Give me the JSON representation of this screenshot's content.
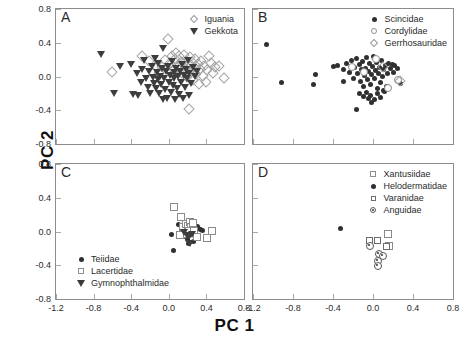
{
  "figure": {
    "xlabel": "PC 1",
    "ylabel": "PC 2"
  },
  "chart_data": {
    "type": "scatter",
    "title": "",
    "xlabel": "PC 1",
    "ylabel": "PC 2",
    "xlim": [
      -1.2,
      0.8
    ],
    "ylim": [
      -0.8,
      0.8
    ],
    "xticks": [
      "-1.2",
      "-0.8",
      "-0.4",
      "0.0",
      "0.4",
      "0.8"
    ],
    "yticks": [
      "0.8",
      "0.4",
      "0.0",
      "-0.4",
      "-0.8"
    ],
    "grid": false,
    "panels": [
      {
        "letter": "A",
        "legend_position": "top-right",
        "series": [
          {
            "name": "Iguania",
            "marker": "diamond-open",
            "points": [
              [
                -0.62,
                0.07
              ],
              [
                -0.3,
                0.26
              ],
              [
                -0.22,
                0.2
              ],
              [
                -0.15,
                0.14
              ],
              [
                -0.12,
                0.05
              ],
              [
                -0.08,
                0.12
              ],
              [
                -0.05,
                0.21
              ],
              [
                -0.02,
                0.46
              ],
              [
                0.0,
                0.17
              ],
              [
                0.02,
                0.26
              ],
              [
                0.04,
                0.09
              ],
              [
                0.06,
                0.22
              ],
              [
                0.07,
                0.29
              ],
              [
                0.09,
                0.13
              ],
              [
                0.1,
                0.25
              ],
              [
                0.12,
                0.18
              ],
              [
                0.13,
                0.05
              ],
              [
                0.15,
                0.27
              ],
              [
                0.16,
                0.11
              ],
              [
                0.17,
                0.2
              ],
              [
                0.18,
                0.01
              ],
              [
                0.2,
                0.15
              ],
              [
                0.21,
                0.24
              ],
              [
                0.22,
                0.08
              ],
              [
                0.24,
                0.18
              ],
              [
                0.25,
                -0.03
              ],
              [
                0.26,
                0.12
              ],
              [
                0.27,
                0.22
              ],
              [
                0.28,
                0.04
              ],
              [
                0.3,
                0.16
              ],
              [
                0.31,
                -0.08
              ],
              [
                0.32,
                0.1
              ],
              [
                0.33,
                0.2
              ],
              [
                0.35,
                0.02
              ],
              [
                0.36,
                0.14
              ],
              [
                0.38,
                -0.05
              ],
              [
                0.4,
                0.09
              ],
              [
                0.42,
                0.26
              ],
              [
                0.44,
                0.17
              ],
              [
                0.46,
                0.05
              ],
              [
                0.48,
                0.13
              ],
              [
                0.52,
                0.14
              ],
              [
                0.58,
                0.0
              ],
              [
                0.2,
                -0.37
              ]
            ]
          },
          {
            "name": "Gekkota",
            "marker": "triangle-down",
            "points": [
              [
                -0.72,
                0.27
              ],
              [
                -0.52,
                0.12
              ],
              [
                -0.58,
                -0.2
              ],
              [
                -0.4,
                0.15
              ],
              [
                -0.34,
                0.04
              ],
              [
                -0.3,
                -0.06
              ],
              [
                -0.28,
                0.09
              ],
              [
                -0.26,
                0.19
              ],
              [
                -0.24,
                -0.02
              ],
              [
                -0.22,
                -0.12
              ],
              [
                -0.21,
                0.06
              ],
              [
                -0.2,
                -0.19
              ],
              [
                -0.18,
                0.13
              ],
              [
                -0.17,
                0.0
              ],
              [
                -0.16,
                -0.08
              ],
              [
                -0.15,
                0.22
              ],
              [
                -0.14,
                -0.14
              ],
              [
                -0.13,
                0.05
              ],
              [
                -0.12,
                -0.03
              ],
              [
                -0.11,
                0.16
              ],
              [
                -0.1,
                -0.2
              ],
              [
                -0.09,
                0.01
              ],
              [
                -0.08,
                -0.09
              ],
              [
                -0.07,
                0.1
              ],
              [
                -0.06,
                0.34
              ],
              [
                -0.05,
                -0.02
              ],
              [
                -0.04,
                -0.15
              ],
              [
                -0.03,
                0.06
              ],
              [
                -0.02,
                -0.25
              ],
              [
                -0.01,
                0.12
              ],
              [
                0.0,
                -0.06
              ],
              [
                0.01,
                0.02
              ],
              [
                0.02,
                -0.18
              ],
              [
                0.03,
                0.18
              ],
              [
                0.04,
                -0.1
              ],
              [
                0.05,
                0.05
              ],
              [
                0.06,
                -0.02
              ],
              [
                0.07,
                -0.27
              ],
              [
                0.08,
                0.1
              ],
              [
                0.09,
                -0.14
              ],
              [
                0.1,
                0.01
              ],
              [
                0.11,
                -0.21
              ],
              [
                0.12,
                0.07
              ],
              [
                0.13,
                -0.06
              ],
              [
                0.14,
                0.15
              ],
              [
                0.15,
                -0.25
              ],
              [
                0.16,
                0.02
              ],
              [
                0.17,
                -0.12
              ],
              [
                0.18,
                0.09
              ],
              [
                0.19,
                -0.02
              ],
              [
                0.2,
                0.2
              ],
              [
                0.21,
                -0.22
              ],
              [
                0.22,
                0.04
              ],
              [
                0.24,
                -0.08
              ],
              [
                0.26,
                0.11
              ],
              [
                0.28,
                0.01
              ],
              [
                0.3,
                0.06
              ],
              [
                -0.38,
                -0.21
              ],
              [
                -0.33,
                -0.22
              ],
              [
                -0.06,
                -0.27
              ]
            ]
          }
        ]
      },
      {
        "letter": "B",
        "legend_position": "top-right",
        "series": [
          {
            "name": "Scincidae",
            "marker": "circle-filled",
            "points": [
              [
                -1.07,
                0.38
              ],
              [
                -0.92,
                -0.07
              ],
              [
                -0.58,
                0.02
              ],
              [
                -0.6,
                -0.1
              ],
              [
                -0.4,
                0.12
              ],
              [
                -0.36,
                0.13
              ],
              [
                -0.3,
                0.08
              ],
              [
                -0.27,
                0.16
              ],
              [
                -0.24,
                0.05
              ],
              [
                -0.22,
                0.19
              ],
              [
                -0.2,
                -0.02
              ],
              [
                -0.19,
                0.11
              ],
              [
                -0.17,
                0.21
              ],
              [
                -0.16,
                0.03
              ],
              [
                -0.14,
                0.14
              ],
              [
                -0.13,
                -0.06
              ],
              [
                -0.12,
                0.08
              ],
              [
                -0.11,
                0.18
              ],
              [
                -0.1,
                -0.12
              ],
              [
                -0.09,
                0.01
              ],
              [
                -0.08,
                0.1
              ],
              [
                -0.07,
                0.22
              ],
              [
                -0.06,
                -0.04
              ],
              [
                -0.05,
                0.06
              ],
              [
                -0.04,
                0.15
              ],
              [
                -0.03,
                -0.09
              ],
              [
                -0.02,
                0.02
              ],
              [
                -0.01,
                0.12
              ],
              [
                0.0,
                0.24
              ],
              [
                0.01,
                -0.02
              ],
              [
                0.02,
                0.07
              ],
              [
                0.03,
                0.17
              ],
              [
                0.04,
                -0.14
              ],
              [
                0.05,
                0.03
              ],
              [
                0.06,
                0.11
              ],
              [
                0.07,
                -0.07
              ],
              [
                0.08,
                0.19
              ],
              [
                0.09,
                0.0
              ],
              [
                0.1,
                0.08
              ],
              [
                0.11,
                -0.18
              ],
              [
                0.12,
                0.13
              ],
              [
                0.14,
                0.04
              ],
              [
                0.15,
                0.15
              ],
              [
                0.17,
                0.09
              ],
              [
                0.19,
                0.14
              ],
              [
                0.2,
                0.05
              ],
              [
                0.21,
                0.13
              ],
              [
                0.24,
                0.1
              ],
              [
                -0.14,
                -0.2
              ],
              [
                -0.1,
                -0.24
              ],
              [
                -0.07,
                -0.19
              ],
              [
                -0.05,
                -0.26
              ],
              [
                -0.03,
                -0.22
              ],
              [
                -0.02,
                -0.31
              ],
              [
                0.01,
                -0.27
              ],
              [
                0.04,
                -0.2
              ],
              [
                0.07,
                -0.25
              ],
              [
                -0.17,
                -0.39
              ],
              [
                0.1,
                -0.16
              ],
              [
                0.13,
                -0.12
              ],
              [
                0.27,
                -0.08
              ],
              [
                -0.3,
                -0.06
              ]
            ]
          },
          {
            "name": "Cordylidae",
            "marker": "circle-open",
            "points": [
              [
                -0.22,
                0.13
              ],
              [
                -0.1,
                0.07
              ],
              [
                0.02,
                0.22
              ],
              [
                0.24,
                -0.03
              ],
              [
                0.14,
                -0.12
              ]
            ]
          },
          {
            "name": "Gerrhosauridae",
            "marker": "diamond-open",
            "points": [
              [
                0.09,
                0.12
              ],
              [
                0.26,
                -0.04
              ]
            ]
          }
        ]
      },
      {
        "letter": "C",
        "legend_position": "bottom-left",
        "series": [
          {
            "name": "Teiidae",
            "marker": "circle-filled",
            "points": [
              [
                0.03,
                -0.03
              ],
              [
                0.1,
                0.08
              ],
              [
                0.13,
                0.02
              ],
              [
                0.16,
                -0.06
              ],
              [
                0.18,
                0.03
              ],
              [
                0.2,
                -0.1
              ],
              [
                0.22,
                0.05
              ],
              [
                0.24,
                -0.02
              ],
              [
                0.26,
                -0.12
              ],
              [
                0.28,
                0.01
              ],
              [
                0.3,
                0.06
              ],
              [
                0.32,
                0.04
              ],
              [
                0.34,
                0.02
              ],
              [
                0.36,
                0.01
              ],
              [
                0.05,
                -0.23
              ],
              [
                0.21,
                -0.14
              ]
            ]
          },
          {
            "name": "Lacertidae",
            "marker": "square-open",
            "points": [
              [
                0.04,
                0.3
              ],
              [
                0.12,
                0.18
              ],
              [
                0.14,
                0.06
              ],
              [
                0.17,
                0.1
              ],
              [
                0.19,
                0.08
              ],
              [
                0.21,
                0.12
              ],
              [
                0.23,
                0.07
              ],
              [
                0.25,
                0.11
              ],
              [
                0.15,
                0.0
              ],
              [
                0.18,
                -0.02
              ],
              [
                0.2,
                0.02
              ],
              [
                0.26,
                0.02
              ],
              [
                0.29,
                -0.05
              ],
              [
                0.4,
                -0.06
              ],
              [
                0.45,
                0.02
              ],
              [
                0.11,
                -0.03
              ]
            ]
          },
          {
            "name": "Gymnophthalmidae",
            "marker": "triangle-down",
            "points": [
              [
                0.16,
                0.0
              ],
              [
                0.19,
                -0.04
              ],
              [
                0.22,
                -0.05
              ],
              [
                0.25,
                -0.03
              ],
              [
                0.23,
                -0.14
              ]
            ]
          }
        ]
      },
      {
        "letter": "D",
        "legend_position": "top-right",
        "series": [
          {
            "name": "Xantusiidae",
            "marker": "square-open",
            "points": [
              [
                0.14,
                -0.02
              ],
              [
                0.15,
                -0.16
              ]
            ]
          },
          {
            "name": "Helodermatidae",
            "marker": "circle-filled",
            "points": [
              [
                -0.33,
                0.04
              ]
            ]
          },
          {
            "name": "Varanidae",
            "marker": "square-small",
            "points": [
              [
                0.12,
                -0.16
              ],
              [
                -0.05,
                -0.1
              ],
              [
                0.03,
                -0.1
              ]
            ]
          },
          {
            "name": "Anguidae",
            "marker": "circle-dot",
            "points": [
              [
                -0.04,
                -0.16
              ],
              [
                0.05,
                -0.26
              ],
              [
                0.09,
                -0.28
              ],
              [
                0.04,
                -0.34
              ],
              [
                0.04,
                -0.4
              ]
            ]
          }
        ]
      }
    ]
  }
}
